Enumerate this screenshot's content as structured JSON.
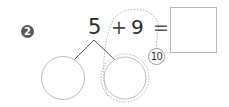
{
  "problem": {
    "number": "2",
    "operand_a": "5",
    "operator": "+",
    "operand_b": "9",
    "equals": "=",
    "answer": "",
    "hint_make_ten": "10"
  },
  "decomposition": {
    "left_part": "",
    "right_part": ""
  },
  "colors": {
    "badge": "#5a5a5a",
    "ink": "#2a2a2a",
    "outline": "#b8b8b8",
    "dashed": "#b0b0b0"
  }
}
